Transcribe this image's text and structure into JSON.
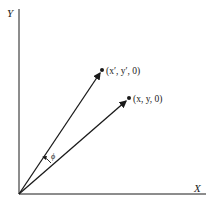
{
  "diagram": {
    "axes": {
      "x_label": "X",
      "y_label": "Y"
    },
    "points": [
      {
        "id": "rotated",
        "label": "(x′, y′, 0)"
      },
      {
        "id": "original",
        "label": "(x, y, 0)"
      }
    ],
    "angle_label": "ϕ",
    "colors": {
      "ink": "#1a1a1a",
      "background": "#ffffff"
    }
  }
}
